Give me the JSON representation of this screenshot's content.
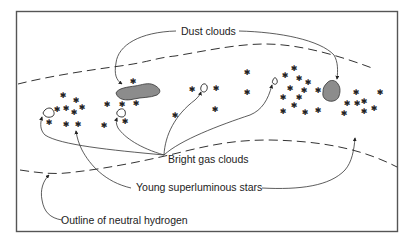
{
  "figure": {
    "labels": {
      "dust_clouds": "Dust clouds",
      "bright_gas_clouds": "Bright gas clouds",
      "young_stars": "Young superluminous stars",
      "neutral_hydrogen": "Outline of neutral hydrogen"
    },
    "icons": {
      "star": "✱"
    },
    "colors": {
      "dust_fill": "#8c8c8c",
      "line": "#333333",
      "frame": "#555555",
      "background": "#ffffff"
    }
  }
}
